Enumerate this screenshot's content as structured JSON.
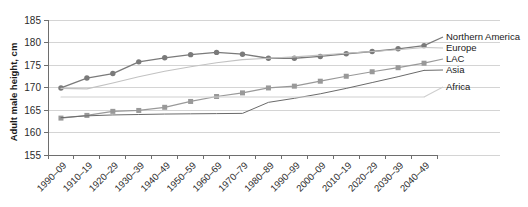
{
  "chart_data": {
    "type": "line",
    "title": "",
    "xlabel": "",
    "ylabel": "Adult male height, cm",
    "ylim": [
      155,
      185
    ],
    "ytick_values": [
      155,
      160,
      165,
      170,
      175,
      180,
      185
    ],
    "ytick_labels": [
      "155",
      "160",
      "165",
      "170",
      "175",
      "180",
      "185"
    ],
    "grid": true,
    "legend_position": "right-outside",
    "categories": [
      "1990–09",
      "1910–19",
      "1920–29",
      "1930–39",
      "1940–49",
      "1950–59",
      "1960–69",
      "1970–79",
      "1980–89",
      "1990–99",
      "2000–09",
      "2010–19",
      "2020–29",
      "2030–39",
      "2040–49"
    ],
    "series": [
      {
        "name": "Northern America",
        "color": "#7a7a7a",
        "marker": "circle",
        "line_width": 1.3,
        "values": [
          169.9,
          172.1,
          173.1,
          175.7,
          176.6,
          177.3,
          177.8,
          177.4,
          176.5,
          176.5,
          176.9,
          177.5,
          178.0,
          178.6,
          179.3
        ]
      },
      {
        "name": "Europe",
        "color": "#c2c2c2",
        "marker": "none",
        "line_width": 1.1,
        "values": [
          169.8,
          169.7,
          171.0,
          172.4,
          173.6,
          174.6,
          175.5,
          176.2,
          176.5,
          176.8,
          177.2,
          177.6,
          178.0,
          178.4,
          178.9
        ]
      },
      {
        "name": "LAC",
        "color": "#999999",
        "marker": "square",
        "line_width": 1.2,
        "values": [
          163.2,
          163.8,
          164.7,
          164.9,
          165.6,
          166.9,
          168.0,
          168.8,
          169.9,
          170.3,
          171.4,
          172.5,
          173.5,
          174.4,
          175.4
        ]
      },
      {
        "name": "Asia",
        "color": "#6a6a6a",
        "marker": "none",
        "line_width": 1.0,
        "values": [
          163.3,
          163.7,
          163.9,
          164.0,
          164.1,
          164.15,
          164.2,
          164.25,
          166.7,
          167.6,
          168.6,
          169.8,
          171.1,
          172.4,
          173.8
        ]
      },
      {
        "name": "Africa",
        "color": "#cfcfcf",
        "marker": "none",
        "line_width": 1.1,
        "values": [
          167.9,
          167.9,
          167.9,
          167.9,
          167.9,
          167.9,
          167.9,
          167.9,
          167.9,
          167.9,
          167.9,
          167.9,
          167.9,
          167.9,
          167.9
        ]
      }
    ],
    "legend_entries": [
      {
        "label": "Northern America",
        "value_at_end": 179.3
      },
      {
        "label": "Europe",
        "value_at_end": 178.9
      },
      {
        "label": "LAC",
        "value_at_end": 175.4
      },
      {
        "label": "Asia",
        "value_at_end": 173.8
      },
      {
        "label": "Africa",
        "value_at_end": 167.9
      }
    ]
  }
}
